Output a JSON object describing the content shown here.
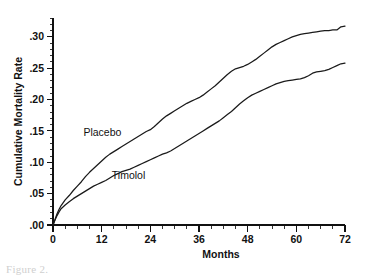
{
  "figure": {
    "caption": "Figure 2.",
    "background_color": "#ffffff",
    "ink_color": "#111111"
  },
  "chart_data": {
    "type": "line",
    "title": "",
    "subtitle": "",
    "xlabel": "Months",
    "ylabel": "Cumulative Mortality Rate",
    "xlim": [
      0,
      72
    ],
    "ylim": [
      0.0,
      0.33
    ],
    "grid": false,
    "legend_position": "inline-annotation",
    "x_ticks": [
      0,
      12,
      24,
      36,
      48,
      60,
      72
    ],
    "x_tick_labels": [
      "0",
      "12",
      "24",
      "36",
      "48",
      "60",
      "72"
    ],
    "x_minor_tick_interval": 3,
    "y_ticks": [
      0.0,
      0.05,
      0.1,
      0.15,
      0.2,
      0.25,
      0.3
    ],
    "y_tick_labels": [
      ".00",
      ".05",
      ".10",
      ".15",
      ".20",
      ".25",
      ".30"
    ],
    "y_minor_tick_interval": 0.01,
    "annotations": [
      {
        "text": "Placebo",
        "x": 7.5,
        "y": 0.142
      },
      {
        "text": "Timolol",
        "x": 14.5,
        "y": 0.074
      }
    ],
    "series": [
      {
        "name": "Placebo",
        "color": "#1a1a1a",
        "x": [
          0,
          0.5,
          1,
          1.5,
          2,
          3,
          4,
          5,
          6,
          7,
          8,
          9,
          10,
          11,
          12,
          13,
          14,
          15,
          16,
          17,
          18,
          19,
          20,
          21,
          22,
          23,
          24,
          25,
          26,
          27,
          28,
          29,
          30,
          31,
          32,
          33,
          34,
          35,
          36,
          37,
          38,
          39,
          40,
          41,
          42,
          43,
          44,
          45,
          46,
          47,
          48,
          49,
          50,
          51,
          52,
          53,
          54,
          55,
          56,
          57,
          58,
          59,
          60,
          61,
          62,
          63,
          64,
          65,
          66,
          67,
          68,
          69,
          70,
          71,
          72
        ],
        "values": [
          0.0,
          0.009,
          0.018,
          0.025,
          0.031,
          0.04,
          0.047,
          0.055,
          0.062,
          0.069,
          0.077,
          0.084,
          0.09,
          0.096,
          0.102,
          0.108,
          0.113,
          0.117,
          0.121,
          0.125,
          0.129,
          0.133,
          0.137,
          0.141,
          0.145,
          0.149,
          0.152,
          0.157,
          0.163,
          0.169,
          0.174,
          0.178,
          0.182,
          0.186,
          0.19,
          0.194,
          0.197,
          0.2,
          0.203,
          0.207,
          0.212,
          0.217,
          0.222,
          0.228,
          0.234,
          0.24,
          0.245,
          0.249,
          0.251,
          0.253,
          0.256,
          0.26,
          0.264,
          0.269,
          0.274,
          0.279,
          0.284,
          0.288,
          0.291,
          0.294,
          0.297,
          0.3,
          0.302,
          0.304,
          0.305,
          0.306,
          0.307,
          0.308,
          0.309,
          0.31,
          0.31,
          0.311,
          0.311,
          0.316,
          0.317
        ]
      },
      {
        "name": "Timolol",
        "color": "#1a1a1a",
        "x": [
          0,
          0.5,
          1,
          1.5,
          2,
          3,
          4,
          5,
          6,
          7,
          8,
          9,
          10,
          11,
          12,
          13,
          14,
          15,
          16,
          17,
          18,
          19,
          20,
          21,
          22,
          23,
          24,
          25,
          26,
          27,
          28,
          29,
          30,
          31,
          32,
          33,
          34,
          35,
          36,
          37,
          38,
          39,
          40,
          41,
          42,
          43,
          44,
          45,
          46,
          47,
          48,
          49,
          50,
          51,
          52,
          53,
          54,
          55,
          56,
          57,
          58,
          59,
          60,
          61,
          62,
          63,
          64,
          65,
          66,
          67,
          68,
          69,
          70,
          71,
          72
        ],
        "values": [
          0.0,
          0.008,
          0.015,
          0.021,
          0.026,
          0.032,
          0.037,
          0.042,
          0.046,
          0.05,
          0.054,
          0.058,
          0.062,
          0.065,
          0.068,
          0.071,
          0.075,
          0.079,
          0.082,
          0.085,
          0.087,
          0.089,
          0.092,
          0.095,
          0.098,
          0.101,
          0.104,
          0.107,
          0.11,
          0.113,
          0.115,
          0.118,
          0.122,
          0.126,
          0.13,
          0.134,
          0.138,
          0.142,
          0.146,
          0.15,
          0.154,
          0.158,
          0.162,
          0.166,
          0.171,
          0.176,
          0.181,
          0.187,
          0.193,
          0.198,
          0.203,
          0.207,
          0.21,
          0.213,
          0.216,
          0.219,
          0.222,
          0.225,
          0.227,
          0.229,
          0.23,
          0.231,
          0.232,
          0.233,
          0.235,
          0.238,
          0.242,
          0.244,
          0.245,
          0.246,
          0.248,
          0.251,
          0.254,
          0.257,
          0.258
        ]
      }
    ]
  }
}
